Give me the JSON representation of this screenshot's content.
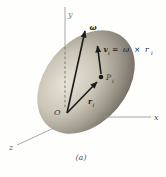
{
  "figure": {
    "caption": "(a)",
    "labels": {
      "axis_x": "x",
      "axis_y": "y",
      "axis_z": "z",
      "origin": "O",
      "omega": "ω",
      "velocity_main": "v",
      "velocity_sub": "i",
      "velocity_equation": "= ω × r",
      "velocity_equation_sub": "i",
      "position_main": "r",
      "position_sub": "i",
      "point_main": "P",
      "point_sub": "i"
    },
    "colors": {
      "background": "#fefefd",
      "body_highlight": "#e8e4d9",
      "body_mid1": "#ccc6b8",
      "body_mid2": "#a39c90",
      "body_mid3": "#766f67",
      "body_shadow": "#49433c",
      "axis": "#929292",
      "dashed_axis": "#6b655c",
      "vector": "#1b1b1b",
      "label_dark": "#333333",
      "label_mid": "#555555",
      "label_light": "#7a7a7a"
    }
  }
}
